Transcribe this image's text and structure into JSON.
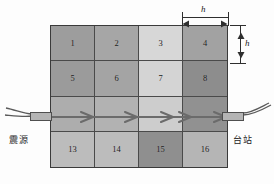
{
  "figure": {
    "background_color": "#fdfdfd",
    "grid_border_color": "#3a3a3a",
    "cell_border_color": "#4a4a4a",
    "ray_color": "#6b6b6b"
  },
  "grid": {
    "rows": 4,
    "columns": 4,
    "cell_width_label": "h",
    "cell_height_label": "h",
    "cells": [
      {
        "id": 1,
        "label": "1",
        "row": 1,
        "col": 1,
        "color": "#9d9d9d"
      },
      {
        "id": 2,
        "label": "2",
        "row": 1,
        "col": 2,
        "color": "#a6a6a6"
      },
      {
        "id": 3,
        "label": "3",
        "row": 1,
        "col": 3,
        "color": "#d7d7d7"
      },
      {
        "id": 4,
        "label": "4",
        "row": 1,
        "col": 4,
        "color": "#a2a2a2"
      },
      {
        "id": 5,
        "label": "5",
        "row": 2,
        "col": 1,
        "color": "#9b9b9b"
      },
      {
        "id": 6,
        "label": "6",
        "row": 2,
        "col": 2,
        "color": "#a4a4a4"
      },
      {
        "id": 7,
        "label": "7",
        "row": 2,
        "col": 3,
        "color": "#d4d4d4"
      },
      {
        "id": 8,
        "label": "8",
        "row": 2,
        "col": 4,
        "color": "#8d8d8d"
      },
      {
        "id": 9,
        "label": "",
        "row": 3,
        "col": 1,
        "color": "#adadad"
      },
      {
        "id": 10,
        "label": "",
        "row": 3,
        "col": 2,
        "color": "#b2b2b2"
      },
      {
        "id": 11,
        "label": "",
        "row": 3,
        "col": 3,
        "color": "#cdcdcd"
      },
      {
        "id": 12,
        "label": "",
        "row": 3,
        "col": 4,
        "color": "#919191"
      },
      {
        "id": 13,
        "label": "13",
        "row": 4,
        "col": 1,
        "color": "#bcbcbc"
      },
      {
        "id": 14,
        "label": "14",
        "row": 4,
        "col": 2,
        "color": "#bcbcbc"
      },
      {
        "id": 15,
        "label": "15",
        "row": 4,
        "col": 3,
        "color": "#8f8f8f"
      },
      {
        "id": 16,
        "label": "16",
        "row": 4,
        "col": 4,
        "color": "#b5b5b5"
      }
    ]
  },
  "ray": {
    "name": "ray-path",
    "direction": "left-to-right",
    "row": 3,
    "arrow_count": 5,
    "color": "#6b6b6b"
  },
  "annotations": {
    "source_label": "震源",
    "station_label": "台站",
    "dimension_horizontal_label": "h",
    "dimension_vertical_label": "h"
  }
}
